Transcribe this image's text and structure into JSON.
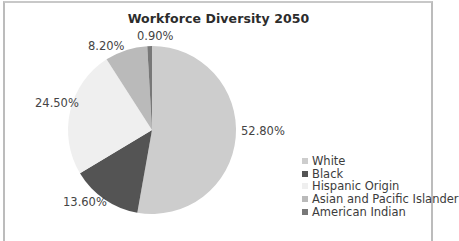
{
  "chart_data": {
    "type": "pie",
    "title": "Workforce Diversity 2050",
    "categories": [
      "White",
      "Black",
      "Hispanic Origin",
      "Asian and Pacific Islander",
      "American Indian"
    ],
    "values": [
      52.8,
      13.6,
      24.5,
      8.2,
      0.9
    ],
    "labels": [
      "52.80%",
      "13.60%",
      "24.50%",
      "8.20%",
      "0.90%"
    ],
    "colors": [
      "#cdcdcd",
      "#545454",
      "#efefef",
      "#bababa",
      "#787878"
    ],
    "legend_position": "right-bottom",
    "start_angle": "12 o'clock, clockwise"
  },
  "legend": [
    {
      "label": "White",
      "color": "#cdcdcd"
    },
    {
      "label": "Black",
      "color": "#545454"
    },
    {
      "label": "Hispanic Origin",
      "color": "#efefef"
    },
    {
      "label": "Asian and Pacific Islander",
      "color": "#bababa"
    },
    {
      "label": "American Indian",
      "color": "#787878"
    }
  ]
}
